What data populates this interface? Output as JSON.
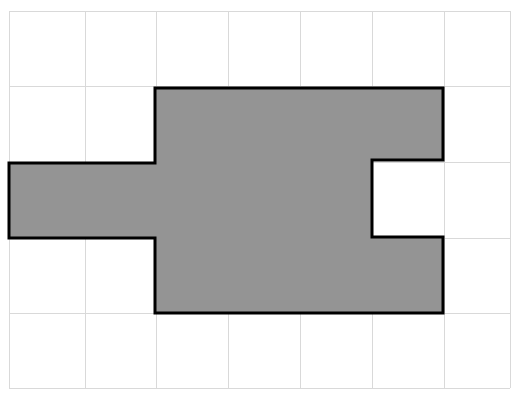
{
  "figure": {
    "canvas": {
      "width": 518,
      "height": 397,
      "background": "#ffffff"
    },
    "grid": {
      "label": "unit-square-grid",
      "columns": 7,
      "rows": 5,
      "origin_x": 9,
      "origin_y": 11,
      "cell_width": 71.7,
      "cell_height": 75.4,
      "line_color": "#d9d9d9",
      "line_width": 1,
      "x_lines": [
        9,
        85,
        156,
        228,
        300,
        372,
        444,
        510
      ],
      "y_lines": [
        11,
        86,
        162,
        238,
        313,
        388
      ]
    },
    "polygon": {
      "label": "shaded-polygon",
      "fill_color": "#949494",
      "stroke_color": "#000000",
      "stroke_width": 3,
      "description": "Rectangle with a left arm extension and a rectangular notch cut from the right edge",
      "vertices": [
        [
          155,
          88
        ],
        [
          443,
          88
        ],
        [
          443,
          160
        ],
        [
          372,
          160
        ],
        [
          372,
          237
        ],
        [
          443,
          237
        ],
        [
          443,
          313
        ],
        [
          155,
          313
        ],
        [
          155,
          238
        ],
        [
          9,
          238
        ],
        [
          9,
          163
        ],
        [
          155,
          163
        ]
      ],
      "area_in_cells": 15
    }
  },
  "chart_data": {
    "type": "table",
    "xlabel": "",
    "ylabel": "",
    "categories": [
      "grid columns",
      "grid rows",
      "shaded unit squares"
    ],
    "values": [
      7,
      5,
      15
    ],
    "grid": true,
    "legend": "none"
  }
}
